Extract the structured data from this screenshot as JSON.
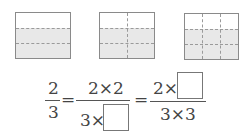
{
  "figures": [
    {
      "rows": 3,
      "cols": 1,
      "shaded_rows": 2
    },
    {
      "rows": 3,
      "cols": 2,
      "shaded_rows": 2
    },
    {
      "rows": 3,
      "cols": 3,
      "shaded_rows": 2
    }
  ],
  "equation": {
    "f1": {
      "num": "2",
      "den": "3"
    },
    "eq1": "=",
    "f2": {
      "num": "2×2",
      "den_prefix": "3×",
      "den_blank": ""
    },
    "eq2": "=",
    "f3": {
      "num_prefix": "2×",
      "num_blank": "",
      "den": "3×3"
    }
  },
  "colors": {
    "shade": "#e8e8e8",
    "border": "#8a8a8a",
    "dash": "#9a9a9a"
  }
}
